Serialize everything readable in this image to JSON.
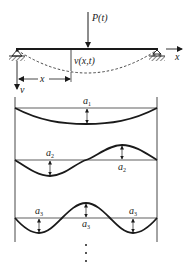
{
  "figure": {
    "beam": {
      "load_label": "P(t)",
      "deflection_label": "v(x,t)",
      "x_axis_label": "x",
      "x_dimension_label": "x",
      "v_axis_label": "v",
      "left_support": "pin",
      "right_support": "roller"
    },
    "modes": [
      {
        "index": 1,
        "amplitude_symbol": "a",
        "amplitude_subscript": "1",
        "half_waves": 1,
        "labels": [
          "a1"
        ]
      },
      {
        "index": 2,
        "amplitude_symbol": "a",
        "amplitude_subscript": "2",
        "half_waves": 2,
        "labels": [
          "a2",
          "a2"
        ]
      },
      {
        "index": 3,
        "amplitude_symbol": "a",
        "amplitude_subscript": "3",
        "half_waves": 3,
        "labels": [
          "a3",
          "a3",
          "a3"
        ]
      }
    ],
    "continuation": "⋮",
    "colors": {
      "ink": "#1a1a1a",
      "hatch": "#333333",
      "background": "#ffffff"
    }
  }
}
